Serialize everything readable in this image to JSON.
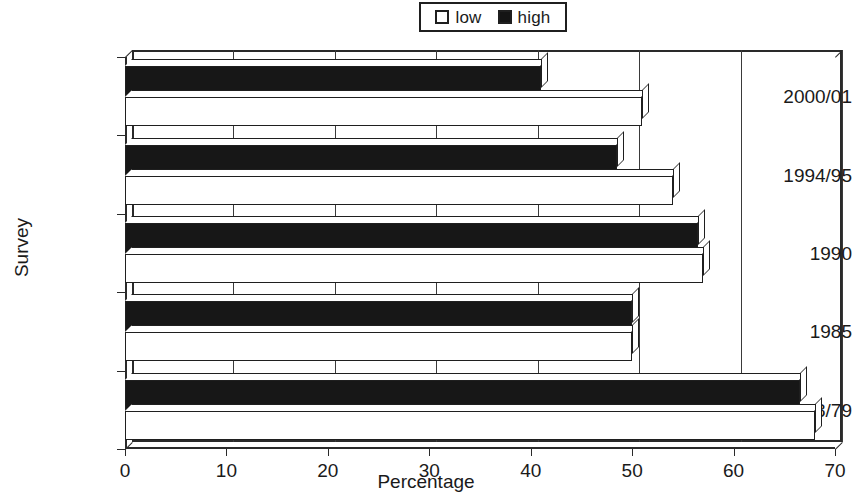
{
  "chart_data": {
    "type": "bar",
    "orientation": "horizontal",
    "title": "",
    "xlabel": "Percentage",
    "ylabel": "Survey",
    "xlim": [
      0,
      70
    ],
    "xticks": [
      0,
      10,
      20,
      30,
      40,
      50,
      60,
      70
    ],
    "grid": true,
    "legend_position": "top-center",
    "categories": [
      "2000/01",
      "1994/95",
      "1990",
      "1985",
      "1978/79"
    ],
    "series": [
      {
        "name": "low",
        "color": "#ffffff",
        "values": [
          51,
          54,
          57,
          50,
          68
        ]
      },
      {
        "name": "high",
        "color": "#171717",
        "values": [
          41,
          48.5,
          56.5,
          50,
          66.5
        ]
      }
    ]
  },
  "legend": {
    "items": [
      {
        "label": "low",
        "swatch": "white-square"
      },
      {
        "label": "high",
        "swatch": "black-square"
      }
    ]
  },
  "axes": {
    "x": {
      "title": "Percentage",
      "tick_labels": [
        "0",
        "10",
        "20",
        "30",
        "40",
        "50",
        "60",
        "70"
      ]
    },
    "y": {
      "title": "Survey",
      "tick_labels": [
        "2000/01",
        "1994/95",
        "1990",
        "1985",
        "1978/79"
      ]
    }
  },
  "colors": {
    "low_fill": "#ffffff",
    "high_fill": "#171717",
    "outline": "#1f1f1f",
    "grid": "#3a3a3a",
    "background": "#ffffff"
  }
}
